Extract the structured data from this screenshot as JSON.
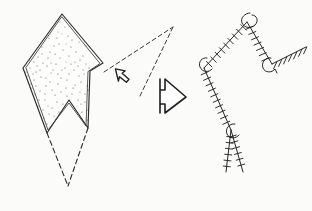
{
  "figure": {
    "title": "Hand-drawn crystal and ticked-polyline structural diagram",
    "background_color": "#fbfbfa",
    "ink_color": "#262626",
    "width": 312,
    "height": 211,
    "style": "pen-and-ink line drawing, scanned",
    "panel_count": 2
  },
  "left_panel": {
    "name": "stippled-crystal",
    "description": "Elongated rhombic crystal with stippled interior, double-drawn edges, a V-notch cut into the base, and dashed construction lines completing the lower apex",
    "fill_texture": "stipple",
    "stipple_dot_count": 230,
    "outline_style": "double-line solid",
    "crystal_outline": [
      [
        62,
        14
      ],
      [
        103,
        63
      ],
      [
        90,
        71
      ],
      [
        88,
        128
      ],
      [
        69,
        100
      ],
      [
        47,
        133
      ],
      [
        23,
        68
      ]
    ],
    "notch": {
      "name": "basal-notch",
      "apex": [
        69,
        100
      ],
      "left_shoulder": [
        47,
        133
      ],
      "right_shoulder": [
        88,
        128
      ]
    },
    "dashed_lower_apex": [
      68,
      186
    ],
    "dashed_edges": [
      [
        [
          47,
          133
        ],
        [
          68,
          186
        ]
      ],
      [
        [
          88,
          128
        ],
        [
          68,
          186
        ]
      ]
    ]
  },
  "center_panel": {
    "name": "transition-arrows",
    "dashed_wedge": {
      "name": "dashed-ray-pair",
      "apex": [
        173,
        27
      ],
      "rays": [
        [
          [
            173,
            27
          ],
          [
            104,
            72
          ]
        ],
        [
          [
            173,
            27
          ],
          [
            140,
            96
          ]
        ]
      ]
    },
    "cursor_arrow": {
      "name": "cursor-arrow-up-left",
      "direction": "up-left",
      "style": "hollow outline",
      "center": [
        121,
        76
      ]
    },
    "block_arrow": {
      "name": "block-arrow-right",
      "direction": "right",
      "style": "hollow outline",
      "center": [
        172,
        96
      ]
    }
  },
  "right_panel": {
    "name": "ticked-polyline",
    "description": "Branching polyline decorated with perpendicular tick marks (barb/hachure symbol) and small open loop markers at three vertices",
    "tick_spacing_px": 6,
    "tick_length_px": 7,
    "loop_marker_count": 3,
    "vertices": [
      [
        247,
        22
      ],
      [
        204,
        68
      ],
      [
        231,
        130
      ],
      [
        240,
        151
      ],
      [
        272,
        64
      ],
      [
        306,
        47
      ]
    ],
    "segments": [
      {
        "name": "segment-upper-left",
        "from": [
          247,
          22
        ],
        "to": [
          204,
          68
        ],
        "ticked": true
      },
      {
        "name": "segment-lower-left",
        "from": [
          204,
          68
        ],
        "to": [
          231,
          130
        ],
        "ticked": true
      },
      {
        "name": "segment-branch-a",
        "from": [
          231,
          130
        ],
        "to": [
          226,
          172
        ],
        "ticked": true
      },
      {
        "name": "segment-branch-b",
        "from": [
          231,
          130
        ],
        "to": [
          243,
          172
        ],
        "ticked": true
      },
      {
        "name": "segment-upper-right",
        "from": [
          247,
          22
        ],
        "to": [
          272,
          64
        ],
        "ticked": true
      },
      {
        "name": "segment-far-right",
        "from": [
          272,
          64
        ],
        "to": [
          306,
          47
        ],
        "ticked": true
      }
    ],
    "loop_markers": [
      {
        "name": "loop-marker-top",
        "at": [
          249,
          18
        ]
      },
      {
        "name": "loop-marker-left",
        "at": [
          204,
          64
        ]
      },
      {
        "name": "loop-marker-junction",
        "at": [
          268,
          66
        ]
      },
      {
        "name": "loop-marker-branch",
        "at": [
          232,
          128
        ]
      }
    ]
  }
}
